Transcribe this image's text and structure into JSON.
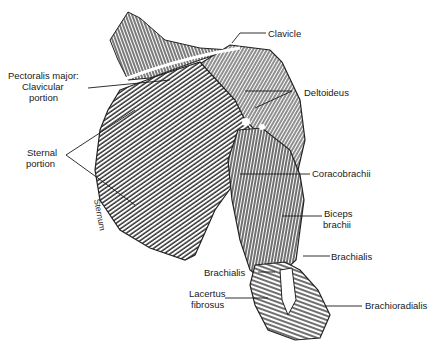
{
  "diagram": {
    "type": "anatomical-illustration",
    "labels": {
      "clavicle": "Clavicle",
      "pectoralis_major": "Pectoralis major:",
      "clavicular": "Clavicular",
      "clavicular_portion": "portion",
      "sternal": "Sternal",
      "sternal_portion": "portion",
      "sternum": "Sternum",
      "deltoideus": "Deltoideus",
      "coracobrachii": "Coracobrachii",
      "biceps": "Biceps",
      "brachii": "brachii",
      "brachialis_right": "Brachialis",
      "brachialis_left": "Brachialis",
      "lacertus": "Lacertus",
      "fibrosus": "fibrosus",
      "brachioradialis": "Brachioradialis"
    },
    "colors": {
      "ink": "#1a1a1a",
      "paper": "#ffffff",
      "shade": "#555555"
    }
  }
}
